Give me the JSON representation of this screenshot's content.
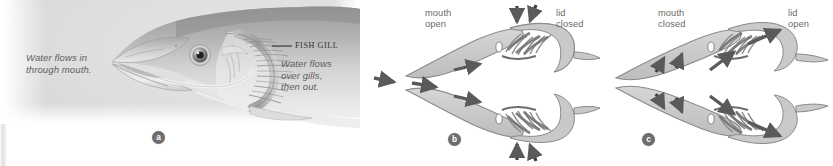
{
  "figure": {
    "background_color": "#ffffff"
  },
  "panel_a": {
    "letter": "a",
    "subject": "fish head cutaway showing gill",
    "callout_label": "FISH GILL",
    "label_in_line1": "Water flows in",
    "label_in_line2": "through mouth.",
    "label_out_line1": "Water flows",
    "label_out_line2": "over gills,",
    "label_out_line3": "then out.",
    "colors": {
      "background": "#dcdcdc",
      "text": "#5e5e5e",
      "callout_text": "#2f2f2f"
    }
  },
  "panel_b": {
    "letter": "b",
    "phase": "inhalation",
    "label_mouth_line1": "mouth",
    "label_mouth_line2": "open",
    "label_lid_line1": "lid",
    "label_lid_line2": "closed",
    "flow_direction": "water in through mouth, over gills",
    "colors": {
      "outline": "#7a7a7a",
      "fill": "#c9c9c9",
      "gill": "#8a8a8a",
      "arrow": "#5a5a5a",
      "text": "#6a6a6a"
    }
  },
  "panel_c": {
    "letter": "c",
    "phase": "exhalation",
    "label_mouth_line1": "mouth",
    "label_mouth_line2": "closed",
    "label_lid_line1": "lid",
    "label_lid_line2": "open",
    "flow_direction": "water out past open operculum",
    "colors": {
      "outline": "#7a7a7a",
      "fill": "#c9c9c9",
      "gill": "#8a8a8a",
      "arrow": "#5a5a5a",
      "text": "#6a6a6a"
    }
  },
  "badges": {
    "a": "a",
    "b": "b",
    "c": "c",
    "background": "#6d6d6d",
    "text_color": "#ffffff"
  }
}
